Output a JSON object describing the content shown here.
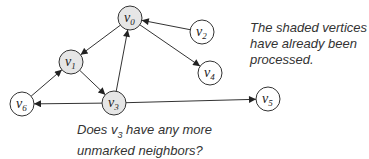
{
  "graph": {
    "nodes": [
      {
        "id": "v0",
        "name": "v",
        "sub": "0",
        "x": 130,
        "y": 18,
        "shaded": true
      },
      {
        "id": "v1",
        "name": "v",
        "sub": "1",
        "x": 71,
        "y": 62,
        "shaded": true
      },
      {
        "id": "v2",
        "name": "v",
        "sub": "2",
        "x": 202,
        "y": 32,
        "shaded": false
      },
      {
        "id": "v3",
        "name": "v",
        "sub": "3",
        "x": 114,
        "y": 103,
        "shaded": true
      },
      {
        "id": "v4",
        "name": "v",
        "sub": "4",
        "x": 210,
        "y": 73,
        "shaded": false
      },
      {
        "id": "v5",
        "name": "v",
        "sub": "5",
        "x": 268,
        "y": 99,
        "shaded": false
      },
      {
        "id": "v6",
        "name": "v",
        "sub": "6",
        "x": 22,
        "y": 104,
        "shaded": false
      }
    ],
    "edges": [
      {
        "from": "v0",
        "to": "v1"
      },
      {
        "from": "v0",
        "to": "v4"
      },
      {
        "from": "v2",
        "to": "v0"
      },
      {
        "from": "v3",
        "to": "v0"
      },
      {
        "from": "v1",
        "to": "v3"
      },
      {
        "from": "v6",
        "to": "v1"
      },
      {
        "from": "v3",
        "to": "v6"
      },
      {
        "from": "v3",
        "to": "v5"
      }
    ],
    "colors": {
      "shaded": "#e6e6e6",
      "unshaded": "#ffffff",
      "stroke": "#333333"
    }
  },
  "captions": {
    "shaded_line1": "The shaded vertices",
    "shaded_line2": "have already been",
    "shaded_line3": "processed.",
    "question_prefix": "Does v",
    "question_sub": "3",
    "question_suffix": " have any more",
    "question_line2": "unmarked neighbors?"
  }
}
